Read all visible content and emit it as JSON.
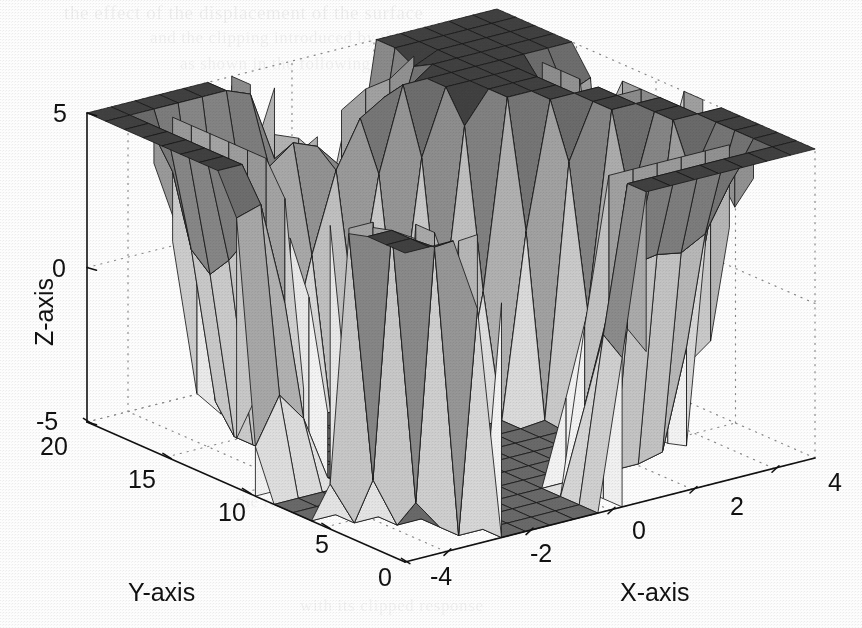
{
  "figure": {
    "kind": "matlab-3d-surface-plot",
    "background_color": "#ffffff",
    "edge_color": "#1a1a1a",
    "axis_line_color": "#111111",
    "grid_style": "dotted",
    "grid_color": "#808080"
  },
  "ghost_text": {
    "line1": "the effect of the displacement of the surface",
    "line2": "and the clipping introduced by the saturation",
    "line3": "as shown in the following figure and",
    "line4": "the resulting surface plot for the",
    "line5": "with its clipped response"
  },
  "axes": {
    "x": {
      "title": "X-axis",
      "ticks": [
        "-4",
        "-2",
        "0",
        "2",
        "4"
      ],
      "values": [
        -4,
        -2,
        0,
        2,
        4
      ],
      "range": [
        -5,
        5
      ]
    },
    "y": {
      "title": "Y-axis",
      "ticks": [
        "20",
        "15",
        "10",
        "5",
        "0"
      ],
      "values": [
        20,
        15,
        10,
        5,
        0
      ],
      "range": [
        0,
        20
      ]
    },
    "z": {
      "title": "Z-axis",
      "ticks": [
        "5",
        "0",
        "-5"
      ],
      "values": [
        5,
        0,
        -5
      ],
      "range": [
        -5,
        5
      ]
    }
  },
  "chart_data": {
    "type": "surface",
    "title": "",
    "subtitle": "",
    "xlabel": "X-axis",
    "ylabel": "Y-axis",
    "zlabel": "Z-axis",
    "xlim": [
      -5,
      5
    ],
    "ylim": [
      0,
      20
    ],
    "zlim": [
      -5,
      5
    ],
    "xticks": [
      -4,
      -2,
      0,
      2,
      4
    ],
    "yticks": [
      0,
      5,
      10,
      15,
      20
    ],
    "zticks": [
      -5,
      0,
      5
    ],
    "grid": true,
    "legend": null,
    "colormap": "gray",
    "shading": "faceted",
    "mesh_nx": 17,
    "mesh_ny": 17,
    "plateau_high_z": 5,
    "plateau_low_z": -5,
    "annotations": []
  },
  "layout": {
    "origin_front": [
      405,
      562
    ],
    "origin_left": [
      87,
      422
    ],
    "origin_right": [
      815,
      458
    ],
    "z_top": [
      87,
      113
    ]
  }
}
